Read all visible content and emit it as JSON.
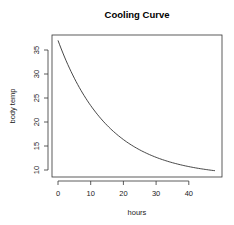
{
  "chart_data": {
    "type": "line",
    "title": "Cooling Curve",
    "xlabel": "hours",
    "ylabel": "body temp",
    "xlim": [
      0,
      48
    ],
    "ylim": [
      9.6,
      37
    ],
    "x_ticks": [
      0,
      10,
      20,
      30,
      40
    ],
    "y_ticks": [
      10,
      15,
      20,
      25,
      30,
      35
    ],
    "grid": false,
    "legend": null,
    "model": "T = 8.6 + 28.4 * exp(-0.065 * t)",
    "series": [
      {
        "name": "body temp",
        "color": "#333333",
        "x": [
          0,
          5,
          10,
          15,
          20,
          25,
          30,
          35,
          40,
          45,
          48
        ],
        "y": [
          37.0,
          29.3,
          23.7,
          19.6,
          16.6,
          14.4,
          12.7,
          11.5,
          10.7,
          10.1,
          9.8
        ]
      }
    ]
  }
}
